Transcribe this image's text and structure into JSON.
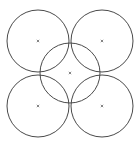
{
  "diagram": {
    "width": 139,
    "height": 145,
    "background": "#ffffff",
    "stroke_color": "#4a4a4a",
    "marker_color": "#666666",
    "circles": [
      {
        "id": "top-left",
        "cx": 38,
        "cy": 41,
        "r": 31
      },
      {
        "id": "top-right",
        "cx": 102,
        "cy": 41,
        "r": 31
      },
      {
        "id": "center",
        "cx": 70,
        "cy": 73,
        "r": 30
      },
      {
        "id": "bottom-left",
        "cx": 38,
        "cy": 106,
        "r": 31
      },
      {
        "id": "bottom-right",
        "cx": 102,
        "cy": 106,
        "r": 31
      }
    ],
    "center_marker": "×"
  }
}
